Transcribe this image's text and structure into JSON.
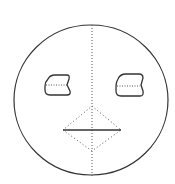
{
  "diagram": {
    "type": "face-sketch",
    "colors": {
      "background": "#ffffff",
      "stroke": "#333333",
      "dotted": "#555555"
    },
    "shapes": {
      "face_circle": {
        "cx": 91,
        "cy": 100,
        "rx": 77,
        "ry": 75
      },
      "center_line": {
        "x": 92,
        "y1": 25,
        "y2": 176,
        "style": "dotted"
      },
      "left_eye": {
        "path": "M48,79 Q50,75 55,75 L67,75 Q70,75 69,79 L67,85 L70,91 Q71,95 67,95 L50,95 Q45,95 45,90 L45,86 Q45,82 48,79 Z",
        "divider": {
          "x1": 46,
          "x2": 68,
          "y": 85
        }
      },
      "right_eye": {
        "path": "M118,79 Q120,74 126,74 L139,74 Q143,74 143,78 L141,85 L143,91 Q144,96 140,96 L121,96 Q116,96 116,91 L116,86 Q116,82 118,79 Z",
        "divider": {
          "x1": 117,
          "x2": 140,
          "y": 86
        }
      },
      "nose_diamond": {
        "points": "92,106 121,130 92,151 63,130",
        "style": "dotted"
      },
      "mouth_line": {
        "x1": 63,
        "x2": 121,
        "y": 130
      }
    }
  }
}
